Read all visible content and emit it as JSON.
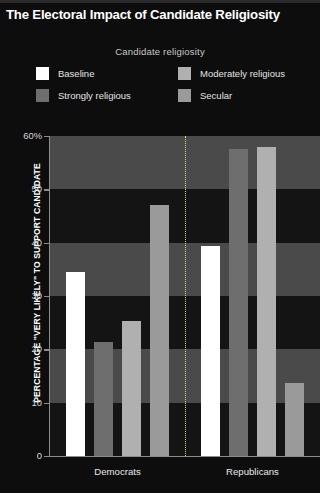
{
  "header": {
    "title": "The Electoral Impact of Candidate Religiosity"
  },
  "legend": {
    "title": "Candidate religiosity",
    "items": [
      {
        "label": "Baseline",
        "color": "#ffffff"
      },
      {
        "label": "Moderately religious",
        "color": "#b0b0b0"
      },
      {
        "label": "Strongly religious",
        "color": "#6e6e6e"
      },
      {
        "label": "Secular",
        "color": "#9a9a9a"
      }
    ]
  },
  "chart_data": {
    "type": "bar",
    "title": "The Electoral Impact of Candidate Religiosity",
    "xlabel": "",
    "ylabel": "PERCENTAGE \"VERY LIKELY\" TO SUPPORT CANDIDATE",
    "legend_title": "Candidate religiosity",
    "legend_position": "top",
    "grid": "horizontal-bands",
    "ylim": [
      0,
      60
    ],
    "ytick_labels": [
      "60%",
      "50",
      "40",
      "30",
      "20",
      "10",
      "0"
    ],
    "yticks": [
      60,
      50,
      40,
      30,
      20,
      10,
      0
    ],
    "categories": [
      "Democrats",
      "Republicans"
    ],
    "series": [
      {
        "name": "Baseline",
        "color": "#ffffff",
        "values": [
          34.5,
          39.4
        ]
      },
      {
        "name": "Strongly religious",
        "color": "#6e6e6e",
        "values": [
          21.3,
          57.5
        ]
      },
      {
        "name": "Moderately religious",
        "color": "#b0b0b0",
        "values": [
          25.3,
          58.0
        ]
      },
      {
        "name": "Secular",
        "color": "#9a9a9a",
        "values": [
          47.0,
          13.7
        ]
      }
    ]
  }
}
